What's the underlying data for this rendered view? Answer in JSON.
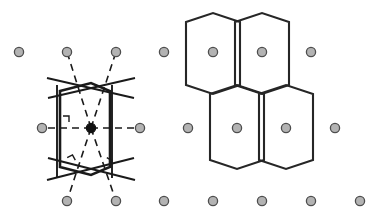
{
  "figure": {
    "panels": [
      {
        "id": "left",
        "name": "construction-panel",
        "caption": "",
        "description": "Perpendicular bisectors of vectors from the central lattice point to its neighbours enclose the Wigner-Seitz cell"
      },
      {
        "id": "right",
        "name": "tiling-panel",
        "caption": "",
        "description": "Four Wigner-Seitz cells tiling the plane, each containing one lattice point"
      }
    ]
  },
  "style": {
    "background": "#ffffff",
    "lattice_dot_fill": "#b3b3b3",
    "lattice_dot_stroke": "#4d4d4d",
    "lattice_dot_radius": 4.6,
    "origin_dot_fill": "#111111",
    "origin_dot_radius": 4.6,
    "solid_line_color": "#1a1a1a",
    "dashed_line_color": "#1a1a1a",
    "hexagon_line_color": "#262626",
    "solid_line_width": 1.9,
    "dashed_line_width": 1.6,
    "hexagon_line_width": 2.1,
    "dash_pattern": "7,5",
    "right_angle_marker_color": "#1a1a1a"
  },
  "lattice": {
    "label": "lattice-points",
    "rows": [
      {
        "row": 1,
        "y": 52,
        "points": [
          {
            "x": 19,
            "y": 52,
            "kind": "neighbour"
          },
          {
            "x": 67,
            "y": 52,
            "kind": "neighbour"
          },
          {
            "x": 116,
            "y": 52,
            "kind": "neighbour"
          },
          {
            "x": 164,
            "y": 52,
            "kind": "neighbour"
          },
          {
            "x": 213,
            "y": 52,
            "kind": "neighbour"
          },
          {
            "x": 262,
            "y": 52,
            "kind": "neighbour"
          },
          {
            "x": 311,
            "y": 52,
            "kind": "neighbour"
          }
        ]
      },
      {
        "row": 2,
        "y": 128,
        "points": [
          {
            "x": 42,
            "y": 128,
            "kind": "neighbour"
          },
          {
            "x": 91,
            "y": 128,
            "kind": "neighbour"
          },
          {
            "x": 140,
            "y": 128,
            "kind": "neighbour"
          },
          {
            "x": 188,
            "y": 128,
            "kind": "neighbour"
          },
          {
            "x": 237,
            "y": 128,
            "kind": "neighbour"
          },
          {
            "x": 286,
            "y": 128,
            "kind": "neighbour"
          },
          {
            "x": 335,
            "y": 128,
            "kind": "neighbour"
          }
        ]
      },
      {
        "row": 3,
        "y": 201,
        "points": [
          {
            "x": 67,
            "y": 201,
            "kind": "neighbour"
          },
          {
            "x": 116,
            "y": 201,
            "kind": "neighbour"
          },
          {
            "x": 164,
            "y": 201,
            "kind": "neighbour"
          },
          {
            "x": 213,
            "y": 201,
            "kind": "neighbour"
          },
          {
            "x": 262,
            "y": 201,
            "kind": "neighbour"
          },
          {
            "x": 311,
            "y": 201,
            "kind": "neighbour"
          },
          {
            "x": 360,
            "y": 201,
            "kind": "neighbour"
          }
        ]
      }
    ],
    "origin": {
      "x": 91,
      "y": 128,
      "kind": "origin",
      "label": "central-lattice-point"
    }
  },
  "construction": {
    "connector_lines": [
      {
        "from": [
          91,
          128
        ],
        "to": [
          67,
          52
        ],
        "style": "dashed",
        "name": "connector-upper-left"
      },
      {
        "from": [
          91,
          128
        ],
        "to": [
          116,
          52
        ],
        "style": "dashed",
        "name": "connector-upper-right"
      },
      {
        "from": [
          91,
          128
        ],
        "to": [
          42,
          128
        ],
        "style": "dashed",
        "name": "connector-left"
      },
      {
        "from": [
          91,
          128
        ],
        "to": [
          140,
          128
        ],
        "style": "dashed",
        "name": "connector-right"
      },
      {
        "from": [
          91,
          128
        ],
        "to": [
          67,
          201
        ],
        "style": "dashed",
        "name": "connector-lower-left"
      },
      {
        "from": [
          91,
          128
        ],
        "to": [
          116,
          201
        ],
        "style": "dashed",
        "name": "connector-lower-right"
      }
    ],
    "bisector_lines": [
      {
        "from": [
          57,
          85
        ],
        "to": [
          57,
          178
        ],
        "style": "solid",
        "name": "bisector-left-vertical"
      },
      {
        "from": [
          112,
          85
        ],
        "to": [
          112,
          178
        ],
        "style": "solid",
        "name": "bisector-right-vertical"
      },
      {
        "from": [
          48,
          98
        ],
        "to": [
          135,
          78
        ],
        "style": "solid",
        "name": "bisector-upper-left"
      },
      {
        "from": [
          47,
          78
        ],
        "to": [
          134,
          98
        ],
        "style": "solid",
        "name": "bisector-upper-right"
      },
      {
        "from": [
          48,
          158
        ],
        "to": [
          135,
          180
        ],
        "style": "solid",
        "name": "bisector-lower-left"
      },
      {
        "from": [
          47,
          180
        ],
        "to": [
          134,
          158
        ],
        "style": "solid",
        "name": "bisector-lower-right"
      }
    ],
    "cell_outline": {
      "name": "wigner-seitz-cell-outline",
      "points": [
        [
          60,
          91
        ],
        [
          91,
          83
        ],
        [
          110,
          91
        ],
        [
          110,
          167
        ],
        [
          91,
          175
        ],
        [
          60,
          167
        ]
      ]
    },
    "right_angle_markers": [
      {
        "x": 63,
        "y": 122,
        "rotation": 0,
        "name": "right-angle-marker-left"
      },
      {
        "x": 70,
        "y": 163,
        "rotation": -28,
        "name": "right-angle-marker-lower-left"
      },
      {
        "x": 104,
        "y": 163,
        "rotation": 28,
        "name": "right-angle-marker-lower-right"
      }
    ]
  },
  "tiling": {
    "name": "wigner-seitz-tiling",
    "cells": [
      {
        "name": "cell-top-left",
        "center": [
          213,
          52
        ],
        "points": [
          [
            186,
            22
          ],
          [
            213,
            13
          ],
          [
            240,
            22
          ],
          [
            240,
            85
          ],
          [
            213,
            94
          ],
          [
            186,
            85
          ]
        ]
      },
      {
        "name": "cell-top-right",
        "center": [
          262,
          52
        ],
        "points": [
          [
            235,
            22
          ],
          [
            262,
            13
          ],
          [
            289,
            22
          ],
          [
            289,
            85
          ],
          [
            262,
            94
          ],
          [
            235,
            85
          ]
        ]
      },
      {
        "name": "cell-bottom-left",
        "center": [
          237,
          128
        ],
        "points": [
          [
            210,
            94
          ],
          [
            237,
            85
          ],
          [
            264,
            94
          ],
          [
            264,
            160
          ],
          [
            237,
            169
          ],
          [
            210,
            160
          ]
        ]
      },
      {
        "name": "cell-bottom-right",
        "center": [
          286,
          128
        ],
        "points": [
          [
            259,
            94
          ],
          [
            286,
            85
          ],
          [
            313,
            94
          ],
          [
            313,
            160
          ],
          [
            286,
            169
          ],
          [
            259,
            160
          ]
        ]
      }
    ]
  }
}
